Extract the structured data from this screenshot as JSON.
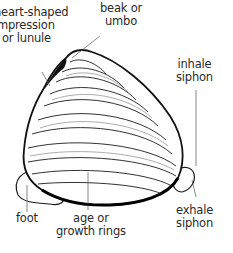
{
  "diagram": {
    "labels": {
      "lunule": {
        "line1": "heart-shaped",
        "line2": "impression",
        "line3": "or lunule"
      },
      "beak": {
        "line1": "beak or",
        "line2": "umbo"
      },
      "inhale_siphon": {
        "line1": "inhale",
        "line2": "siphon"
      },
      "foot": {
        "line1": "foot"
      },
      "growth_rings": {
        "line1": "age or",
        "line2": "growth rings"
      },
      "exhale_siphon": {
        "line1": "exhale",
        "line2": "siphon"
      }
    },
    "colors": {
      "ink": "#1a1a1a",
      "background": "#ffffff",
      "text": "#2a2a2a"
    }
  }
}
